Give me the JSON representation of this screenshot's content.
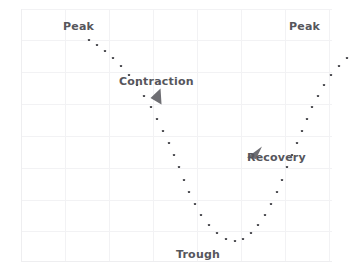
{
  "figure": {
    "background_color": "#ffffff",
    "plot_background_color": "#ffffff",
    "grid_color": "#f2f2f4",
    "axis_line_color": "#f0f0f2",
    "marker_color": "#4d4d52",
    "label_color": "#56565c",
    "arrow_color": "#6e6e73"
  },
  "labels": {
    "peak_left": "Peak",
    "contraction": "Contraction",
    "trough": "Trough",
    "recovery": "Recovery",
    "peak_right": "Peak"
  },
  "icons": {
    "contraction_arrow": "arrow-down-left-icon",
    "recovery_arrow": "arrow-up-left-icon"
  },
  "chart_data": {
    "type": "scatter",
    "title": "",
    "xlabel": "",
    "ylabel": "",
    "xlim": [
      0,
      311
    ],
    "ylim": [
      253,
      0
    ],
    "grid": true,
    "legend": "none",
    "annotations": [
      {
        "text": "Peak",
        "x": 64,
        "y": 19
      },
      {
        "text": "Contraction",
        "x": 122,
        "y": 75
      },
      {
        "text": "Trough",
        "x": 178,
        "y": 251
      },
      {
        "text": "Recovery",
        "x": 250,
        "y": 152
      },
      {
        "text": "Peak",
        "x": 290,
        "y": 19
      }
    ],
    "arrows": [
      {
        "name": "contraction_arrow",
        "x": 135,
        "y": 91,
        "angle_deg": 250
      },
      {
        "name": "recovery_arrow",
        "x": 233,
        "y": 150,
        "angle_deg": 160
      }
    ],
    "points": [
      [
        68,
        31
      ],
      [
        76,
        36
      ],
      [
        84,
        42
      ],
      [
        92,
        49
      ],
      [
        100,
        57
      ],
      [
        108,
        66
      ],
      [
        116,
        76
      ],
      [
        123,
        87
      ],
      [
        130,
        98
      ],
      [
        136,
        110
      ],
      [
        142,
        122
      ],
      [
        148,
        134
      ],
      [
        153,
        146
      ],
      [
        158,
        158
      ],
      [
        163,
        171
      ],
      [
        168,
        183
      ],
      [
        174,
        195
      ],
      [
        180,
        206
      ],
      [
        188,
        216
      ],
      [
        196,
        224
      ],
      [
        205,
        230
      ],
      [
        214,
        232
      ],
      [
        222,
        230
      ],
      [
        230,
        224
      ],
      [
        237,
        216
      ],
      [
        244,
        206
      ],
      [
        250,
        195
      ],
      [
        256,
        183
      ],
      [
        261,
        171
      ],
      [
        266,
        158
      ],
      [
        271,
        146
      ],
      [
        276,
        134
      ],
      [
        281,
        122
      ],
      [
        286,
        110
      ],
      [
        291,
        98
      ],
      [
        297,
        87
      ],
      [
        303,
        76
      ],
      [
        310,
        66
      ],
      [
        318,
        57
      ],
      [
        326,
        49
      ]
    ]
  }
}
